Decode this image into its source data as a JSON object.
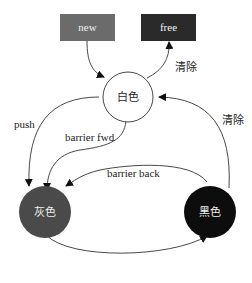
{
  "nodes": {
    "new": {
      "label": "new",
      "color": "#6b6b6b"
    },
    "free": {
      "label": "free",
      "color": "#2a2a2a"
    },
    "white": {
      "label": "白色",
      "color": "#ffffff"
    },
    "gray": {
      "label": "灰色",
      "color": "#4a4a4a"
    },
    "black": {
      "label": "黑色",
      "color": "#0d0d0d"
    }
  },
  "edges": {
    "new_to_white": "",
    "white_to_free": "清除",
    "black_to_white": "清除",
    "white_to_gray_push": "push",
    "white_to_gray_fwd": "barrier fwd",
    "black_to_gray_back": "barrier back",
    "gray_to_black": "pop"
  }
}
